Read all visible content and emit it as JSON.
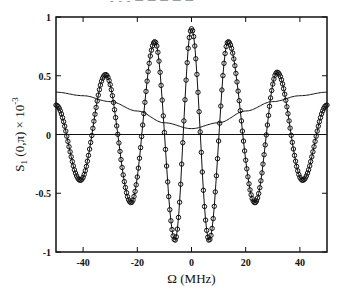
{
  "chart_data": {
    "type": "line",
    "title": "",
    "xlabel": "Ω  (MHz)",
    "ylabel": "S_1(0,π) × 10^-3",
    "xlim": [
      -50,
      50
    ],
    "ylim": [
      -1,
      1
    ],
    "xticks": [
      -40,
      -20,
      0,
      20,
      40
    ],
    "yticks": [
      1,
      0.5,
      0,
      -0.5,
      -1
    ],
    "grid": false,
    "legend": null,
    "series": [
      {
        "name": "oscillating (markers)",
        "marker": "circle",
        "x": [
          -50,
          -41,
          -31.7,
          -22.3,
          -13.5,
          -6.1,
          0,
          6.5,
          13.5,
          23.4,
          31.6,
          41,
          50
        ],
        "values": [
          0.25,
          -0.39,
          0.51,
          -0.58,
          0.79,
          -0.9,
          0.9,
          -0.9,
          0.79,
          -0.58,
          0.53,
          -0.39,
          0.25
        ]
      },
      {
        "name": "envelope (solid line)",
        "x": [
          -50,
          -40,
          -30,
          -20,
          -10,
          0,
          10,
          20,
          30,
          40,
          50
        ],
        "values": [
          0.36,
          0.33,
          0.28,
          0.2,
          0.1,
          0.05,
          0.1,
          0.2,
          0.28,
          0.33,
          0.36
        ]
      },
      {
        "name": "zero line",
        "x": [
          -50,
          50
        ],
        "values": [
          0,
          0
        ]
      }
    ]
  },
  "header_text": "- - -  ─ ─ ─ ─ ─"
}
